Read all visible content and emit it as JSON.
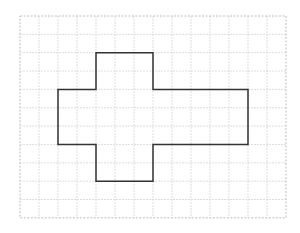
{
  "diagram": {
    "type": "grid-shape",
    "grid": {
      "origin_x": 20,
      "origin_y": 16,
      "cols": 14,
      "rows": 11,
      "cell_w": 19,
      "cell_h": 18.35,
      "line_color": "#d4d4d4",
      "border_color": "#bdbdbd"
    },
    "shape": {
      "name": "cross-polygon",
      "stroke": "#333333",
      "stroke_width": 1.5,
      "points_grid": [
        [
          4,
          2
        ],
        [
          7,
          2
        ],
        [
          7,
          4
        ],
        [
          12,
          4
        ],
        [
          12,
          7
        ],
        [
          7,
          7
        ],
        [
          7,
          9
        ],
        [
          4,
          9
        ],
        [
          4,
          7
        ],
        [
          2,
          7
        ],
        [
          2,
          4
        ],
        [
          4,
          4
        ]
      ]
    }
  }
}
